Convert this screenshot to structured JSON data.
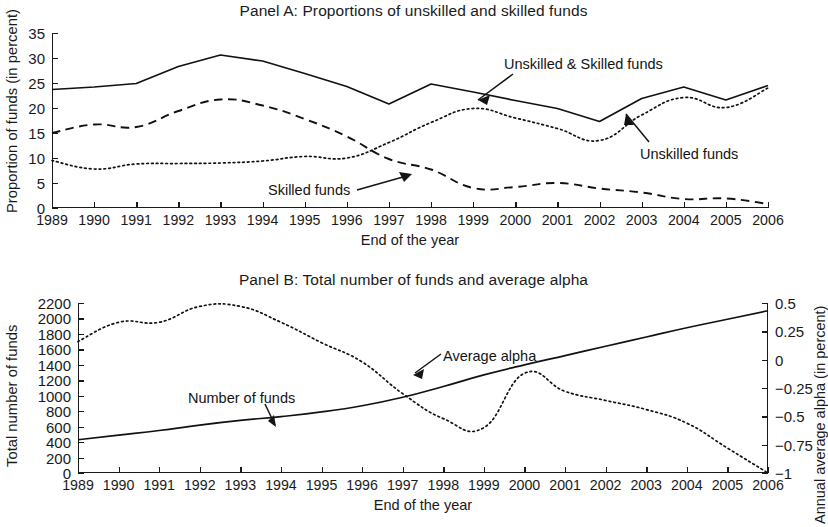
{
  "figure": {
    "panel_a": {
      "title": "Panel A: Proportions of unskilled and skilled funds",
      "xlabel": "End of the year",
      "ylabel": "Proportion of funds (in percent)",
      "yticks": [
        "0",
        "5",
        "10",
        "15",
        "20",
        "25",
        "30",
        "35"
      ],
      "xticks": [
        "1989",
        "1990",
        "1991",
        "1992",
        "1993",
        "1994",
        "1995",
        "1996",
        "1997",
        "1998",
        "1999",
        "2000",
        "2001",
        "2002",
        "2003",
        "2004",
        "2005",
        "2006"
      ],
      "annotations": {
        "combined": "Unskilled & Skilled funds",
        "unskilled": "Unskilled funds",
        "skilled": "Skilled funds"
      }
    },
    "panel_b": {
      "title": "Panel B: Total number of funds and average alpha",
      "xlabel": "End of the year",
      "ylabel_left": "Total number of funds",
      "ylabel_right": "Annual average alpha (in percent)",
      "yticks_left": [
        "0",
        "200",
        "400",
        "600",
        "800",
        "1000",
        "1200",
        "1400",
        "1600",
        "1800",
        "2000",
        "2200"
      ],
      "yticks_right": [
        "-1",
        "-0.75",
        "-0.5",
        "-0.25",
        "0",
        "0.25",
        "0.5"
      ],
      "xticks": [
        "1989",
        "1990",
        "1991",
        "1992",
        "1993",
        "1994",
        "1995",
        "1996",
        "1997",
        "1998",
        "1999",
        "2000",
        "2001",
        "2002",
        "2003",
        "2004",
        "2005",
        "2006"
      ],
      "annotations": {
        "number_of_funds": "Number of funds",
        "average_alpha": "Average alpha"
      }
    }
  },
  "chart_data": [
    {
      "type": "line",
      "panel": "A",
      "title": "Panel A: Proportions of unskilled and skilled funds",
      "xlabel": "End of the year",
      "ylabel": "Proportion of funds (in percent)",
      "grid": false,
      "legend": "in-plot annotations with arrows",
      "x": [
        1989,
        1990,
        1991,
        1992,
        1993,
        1994,
        1995,
        1996,
        1997,
        1998,
        1999,
        2000,
        2001,
        2002,
        2003,
        2004,
        2005,
        2006
      ],
      "xlim": [
        1989,
        2006
      ],
      "ylim": [
        0,
        35
      ],
      "yticks": [
        0,
        5,
        10,
        15,
        20,
        25,
        30,
        35
      ],
      "series": [
        {
          "name": "Unskilled & Skilled funds",
          "style": "solid",
          "values": [
            23.7,
            24.2,
            24.9,
            28.3,
            30.6,
            29.4,
            26.9,
            24.3,
            20.8,
            24.8,
            23.2,
            21.5,
            19.9,
            17.3,
            21.9,
            24.2,
            21.6,
            24.5
          ]
        },
        {
          "name": "Skilled funds",
          "style": "dashed",
          "values": [
            15.0,
            16.7,
            16.2,
            19.4,
            21.7,
            20.5,
            17.8,
            14.3,
            9.8,
            7.7,
            4.0,
            4.2,
            5.0,
            3.9,
            3.1,
            1.8,
            1.9,
            0.8
          ]
        },
        {
          "name": "Unskilled funds",
          "style": "dotted",
          "values": [
            9.5,
            7.8,
            8.8,
            8.9,
            9.0,
            9.4,
            10.3,
            10.0,
            13.1,
            17.1,
            19.9,
            18.0,
            15.9,
            13.5,
            18.6,
            22.1,
            20.1,
            24.0
          ]
        }
      ]
    },
    {
      "type": "line",
      "panel": "B",
      "title": "Panel B: Total number of funds and average alpha",
      "xlabel": "End of the year",
      "ylabel_left": "Total number of funds",
      "ylabel_right": "Annual average alpha (in percent)",
      "grid": false,
      "legend": "in-plot annotations with arrows",
      "x": [
        1989,
        1990,
        1991,
        1992,
        1993,
        1994,
        1995,
        1996,
        1997,
        1998,
        1999,
        2000,
        2001,
        2002,
        2003,
        2004,
        2005,
        2006
      ],
      "xlim": [
        1989,
        2006
      ],
      "ylim_left": [
        0,
        2200
      ],
      "ylim_right": [
        -1,
        0.5
      ],
      "yticks_left": [
        0,
        200,
        400,
        600,
        800,
        1000,
        1200,
        1400,
        1600,
        1800,
        2000,
        2200
      ],
      "yticks_right": [
        -1,
        -0.75,
        -0.5,
        -0.25,
        0,
        0.25,
        0.5
      ],
      "series": [
        {
          "name": "Number of funds",
          "style": "solid",
          "axis": "left",
          "values": [
            430,
            490,
            550,
            620,
            680,
            730,
            790,
            870,
            980,
            1120,
            1270,
            1400,
            1520,
            1640,
            1760,
            1880,
            1990,
            2100
          ]
        },
        {
          "name": "Average alpha",
          "style": "dotted",
          "axis": "right",
          "values": [
            0.16,
            0.33,
            0.33,
            0.47,
            0.47,
            0.33,
            0.15,
            -0.02,
            -0.3,
            -0.52,
            -0.6,
            -0.12,
            -0.28,
            -0.36,
            -0.44,
            -0.56,
            -0.78,
            -1.0
          ]
        }
      ]
    }
  ]
}
